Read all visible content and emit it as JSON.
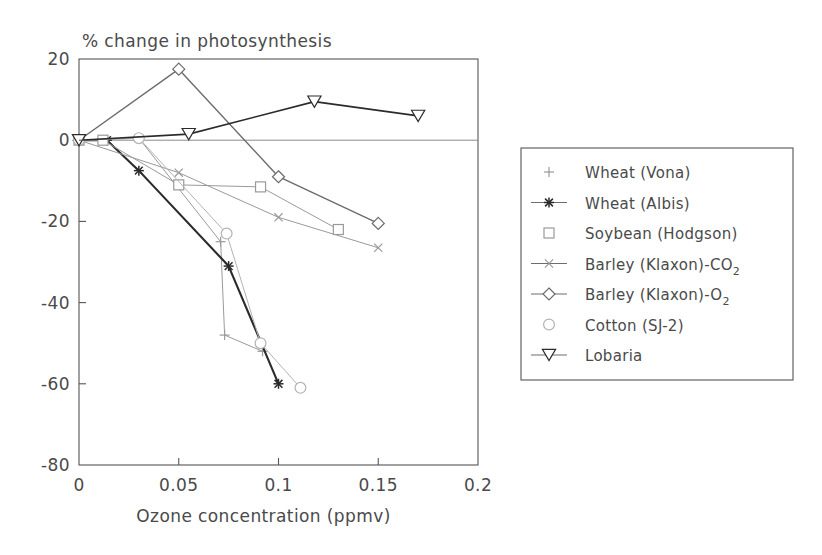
{
  "chart_data": {
    "type": "line",
    "title": "% change in photosynthesis",
    "xlabel": "Ozone concentration (ppmv)",
    "ylabel": "",
    "xlim": [
      0,
      0.2
    ],
    "ylim": [
      -80,
      20
    ],
    "xticks": [
      "0",
      "0.05",
      "0.1",
      "0.15",
      "0.2"
    ],
    "xtick_values": [
      0,
      0.05,
      0.1,
      0.15,
      0.2
    ],
    "yticks": [
      "20",
      "0",
      "-20",
      "-40",
      "-60",
      "-80"
    ],
    "ytick_values": [
      20,
      0,
      -20,
      -40,
      -60,
      -80
    ],
    "grid": false,
    "zero_line": true,
    "legend_position": "right-outside",
    "series": [
      {
        "name": "Wheat (Vona)",
        "label": "Wheat (Vona)",
        "marker": "plus",
        "color": "#9a9a9a",
        "linewidth": 1,
        "x": [
          0,
          0.03,
          0.071,
          0.073,
          0.092
        ],
        "y": [
          0,
          0.5,
          -25,
          -48,
          -52
        ]
      },
      {
        "name": "Wheat (Albis)",
        "label": "Wheat (Albis)",
        "marker": "asterisk",
        "color": "#2b2b2b",
        "linewidth": 2.1,
        "x": [
          0,
          0.014,
          0.03,
          0.075,
          0.1
        ],
        "y": [
          0,
          0,
          -7.5,
          -31,
          -60
        ]
      },
      {
        "name": "Soybean (Hodgson)",
        "label": "Soybean (Hodgson)",
        "marker": "square",
        "color": "#9a9a9a",
        "linewidth": 1,
        "x": [
          0,
          0.012,
          0.05,
          0.091,
          0.13
        ],
        "y": [
          0,
          0,
          -11,
          -11.5,
          -22
        ]
      },
      {
        "name": "Barley (Klaxon)-CO",
        "label": "Barley (Klaxon)-CO",
        "label_sub": "2",
        "marker": "cross",
        "color": "#9a9a9a",
        "linewidth": 1,
        "x": [
          0,
          0.05,
          0.1,
          0.15
        ],
        "y": [
          0,
          -8,
          -19,
          -26.5
        ]
      },
      {
        "name": "Barley (Klaxon)-O",
        "label": "Barley (Klaxon)-O",
        "label_sub": "2",
        "marker": "diamond",
        "color": "#6b6b6b",
        "linewidth": 1.4,
        "x": [
          0,
          0.05,
          0.1,
          0.15
        ],
        "y": [
          0,
          17.5,
          -9,
          -20.5
        ]
      },
      {
        "name": "Cotton (SJ-2)",
        "label": "Cotton (SJ-2)",
        "marker": "circle",
        "color": "#b3b3b3",
        "linewidth": 1,
        "x": [
          0,
          0.03,
          0.074,
          0.091,
          0.111
        ],
        "y": [
          0,
          0.5,
          -23,
          -50,
          -61
        ]
      },
      {
        "name": "Lobaria",
        "label": "Lobaria",
        "marker": "triangle-down",
        "color": "#2b2b2b",
        "linewidth": 1.6,
        "x": [
          0,
          0.055,
          0.118,
          0.17
        ],
        "y": [
          0,
          1.5,
          9.5,
          6
        ]
      }
    ]
  },
  "legend": {
    "items": [
      {
        "label": "Wheat (Vona)",
        "marker": "plus"
      },
      {
        "label": "Wheat (Albis)",
        "marker": "asterisk"
      },
      {
        "label": "Soybean (Hodgson)",
        "marker": "square"
      },
      {
        "label": "Barley (Klaxon)-CO",
        "sub": "2",
        "marker": "cross"
      },
      {
        "label": "Barley (Klaxon)-O",
        "sub": "2",
        "marker": "diamond"
      },
      {
        "label": "Cotton (SJ-2)",
        "marker": "circle"
      },
      {
        "label": "Lobaria",
        "marker": "triangle-down"
      }
    ]
  }
}
